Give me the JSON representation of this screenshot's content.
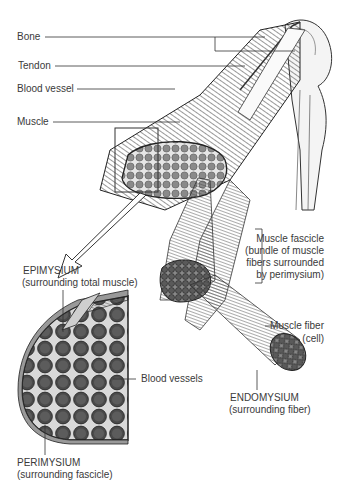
{
  "diagram": {
    "type": "anatomical-illustration",
    "colors": {
      "ink": "#2b2b2b",
      "label_text": "#3a3a3a",
      "fiber_fill": "#6e6e6e",
      "highlight_box": "#ffffff",
      "background": "#ffffff"
    }
  },
  "labels": {
    "bone": "Bone",
    "tendon": "Tendon",
    "blood_vessel": "Blood vessel",
    "muscle": "Muscle",
    "epimysium": "EPIMYSIUM",
    "epimysium_desc": "(surrounding total muscle)",
    "blood_vessels": "Blood vessels",
    "perimysium": "PERIMYSIUM",
    "perimysium_desc": "(surrounding fascicle)",
    "muscle_fascicle_lines": [
      "Muscle fascicle",
      "(bundle of muscle",
      "fibers surrounded",
      "by perimysium)"
    ],
    "muscle_fiber": "Muscle fiber",
    "muscle_fiber_desc": "(cell)",
    "endomysium": "ENDOMYSIUM",
    "endomysium_desc": "(surrounding fiber)"
  }
}
